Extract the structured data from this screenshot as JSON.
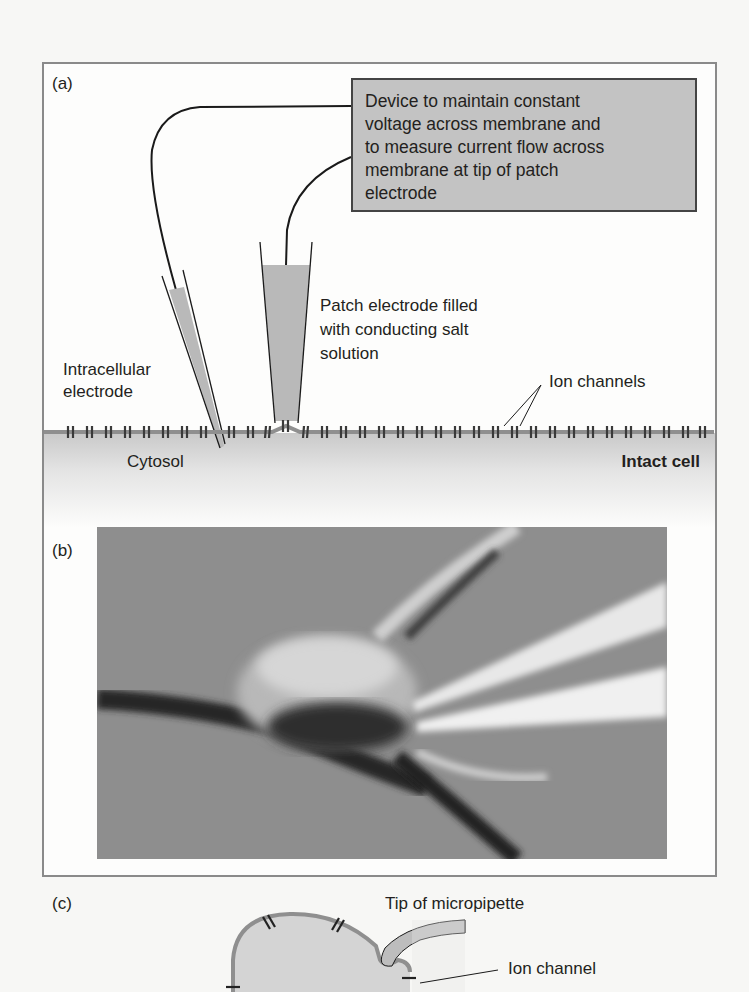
{
  "panel_a": {
    "label": "(a)",
    "device_box_lines": [
      "Device to maintain constant",
      "voltage across membrane and",
      "to measure current flow across",
      "membrane at tip of patch",
      "electrode"
    ],
    "patch_electrode_lines": [
      "Patch electrode filled",
      "with conducting salt",
      "solution"
    ],
    "intracellular_lines": [
      "Intracellular",
      "electrode"
    ],
    "ion_channels": "Ion channels",
    "cytosol": "Cytosol",
    "intact_cell": "Intact cell"
  },
  "panel_b": {
    "label": "(b)",
    "photo": "micrograph-neuron-with-micropipettes"
  },
  "panel_c": {
    "label": "(c)",
    "tip_of_micropipette": "Tip of micropipette",
    "ion_channel": "Ion channel"
  },
  "colors": {
    "frame": "#8a8a8a",
    "box_fill": "#c3c3c3",
    "electrode_fill": "#b9b9b9",
    "membrane": "#8f8f8f",
    "text": "#231f20"
  }
}
